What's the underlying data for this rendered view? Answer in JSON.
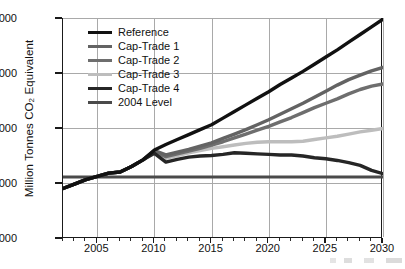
{
  "chart_data": {
    "type": "line",
    "title": "",
    "xlabel": "",
    "ylabel": "Million Tonnes CO2 Equivalent",
    "ylabel_prefix": "Million Tonnes CO",
    "ylabel_sub": "2",
    "ylabel_suffix": " Equivalent",
    "xlim": [
      2002,
      2030
    ],
    "ylim": [
      6000,
      10000
    ],
    "grid": true,
    "legend_position": "upper-left-inside",
    "yticks": [
      "6,000",
      "7,000",
      "8,000",
      "9,000",
      "10,000"
    ],
    "ytick_values": [
      6000,
      7000,
      8000,
      9000,
      10000
    ],
    "xticks": [
      "2005",
      "2010",
      "2015",
      "2020",
      "2025",
      "2030"
    ],
    "xtick_values": [
      2005,
      2010,
      2015,
      2020,
      2025,
      2030
    ],
    "x": [
      2002,
      2003,
      2004,
      2005,
      2006,
      2007,
      2008,
      2009,
      2010,
      2011,
      2012,
      2013,
      2014,
      2015,
      2016,
      2017,
      2018,
      2019,
      2020,
      2021,
      2022,
      2023,
      2024,
      2025,
      2026,
      2027,
      2028,
      2029,
      2030
    ],
    "series": [
      {
        "name": "Reference",
        "color": "#111111",
        "width": 3.4,
        "values": [
          6900,
          6980,
          7060,
          7120,
          7180,
          7200,
          7300,
          7420,
          7600,
          7700,
          7790,
          7880,
          7970,
          8060,
          8180,
          8300,
          8420,
          8540,
          8660,
          8790,
          8910,
          9030,
          9160,
          9290,
          9420,
          9560,
          9700,
          9840,
          9980
        ]
      },
      {
        "name": "Cap-Trade 1",
        "color": "#636363",
        "width": 3.4,
        "values": [
          6900,
          6980,
          7060,
          7120,
          7180,
          7200,
          7300,
          7420,
          7590,
          7510,
          7560,
          7610,
          7670,
          7730,
          7810,
          7890,
          7970,
          8060,
          8150,
          8250,
          8350,
          8450,
          8560,
          8670,
          8780,
          8880,
          8960,
          9040,
          9100
        ]
      },
      {
        "name": "Cap-Trade 2",
        "color": "#6e6e6e",
        "width": 3.4,
        "values": [
          6900,
          6980,
          7060,
          7120,
          7180,
          7200,
          7300,
          7420,
          7570,
          7480,
          7530,
          7580,
          7630,
          7690,
          7750,
          7820,
          7890,
          7960,
          8030,
          8110,
          8190,
          8280,
          8370,
          8450,
          8530,
          8620,
          8700,
          8760,
          8800
        ]
      },
      {
        "name": "Cap-Trade 3",
        "color": "#bdbdbd",
        "width": 3.4,
        "values": [
          6900,
          6980,
          7060,
          7120,
          7180,
          7200,
          7300,
          7420,
          7560,
          7450,
          7500,
          7550,
          7590,
          7630,
          7660,
          7690,
          7720,
          7740,
          7750,
          7750,
          7750,
          7760,
          7790,
          7820,
          7850,
          7890,
          7930,
          7960,
          7990
        ]
      },
      {
        "name": "Cap-Trade 4",
        "color": "#262626",
        "width": 3.4,
        "values": [
          6900,
          6980,
          7060,
          7120,
          7180,
          7200,
          7300,
          7420,
          7540,
          7380,
          7430,
          7470,
          7490,
          7500,
          7520,
          7550,
          7540,
          7530,
          7520,
          7510,
          7510,
          7490,
          7460,
          7440,
          7410,
          7370,
          7320,
          7230,
          7170
        ]
      },
      {
        "name": "2004 Level",
        "color": "#4a4a4a",
        "width": 3.0,
        "constant": 7110,
        "values": [
          7110,
          7110,
          7110,
          7110,
          7110,
          7110,
          7110,
          7110,
          7110,
          7110,
          7110,
          7110,
          7110,
          7110,
          7110,
          7110,
          7110,
          7110,
          7110,
          7110,
          7110,
          7110,
          7110,
          7110,
          7110,
          7110,
          7110,
          7110,
          7110
        ]
      }
    ]
  },
  "legend": {
    "items": [
      {
        "label": "Reference",
        "color": "#111111"
      },
      {
        "label": "Cap-Trade 1",
        "color": "#636363"
      },
      {
        "label": "Cap-Trade 2",
        "color": "#6e6e6e"
      },
      {
        "label": "Cap-Trade 3",
        "color": "#bdbdbd"
      },
      {
        "label": "Cap-Trade 4",
        "color": "#262626"
      },
      {
        "label": "2004 Level",
        "color": "#4a4a4a"
      }
    ]
  },
  "axes": {
    "y_title_prefix": "Million Tonnes CO",
    "y_title_sub": "2",
    "y_title_suffix": " Equivalent"
  }
}
